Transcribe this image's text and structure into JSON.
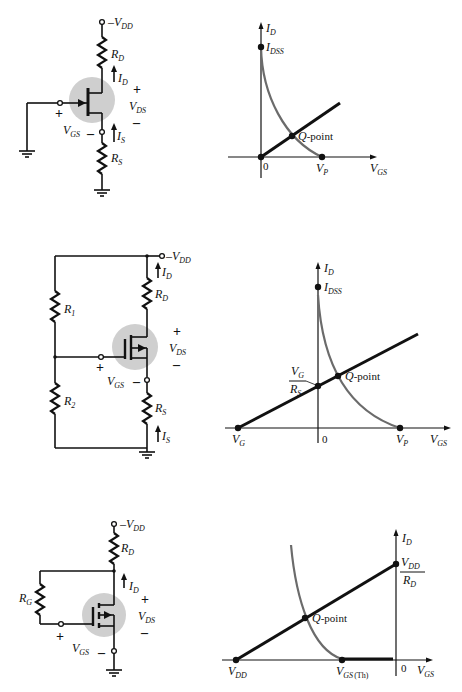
{
  "figure": {
    "panels": [
      {
        "id": "jfet-self-bias",
        "circuit": {
          "supply": {
            "prefix": "–V",
            "sub": "DD"
          },
          "drain_resistor": {
            "main": "R",
            "sub": "D"
          },
          "drain_current": {
            "main": "I",
            "sub": "D"
          },
          "source_current": {
            "main": "I",
            "sub": "S"
          },
          "source_resistor": {
            "main": "R",
            "sub": "S"
          },
          "vds": {
            "main": "V",
            "sub": "DS",
            "plus": "+",
            "minus": "–"
          },
          "vgs": {
            "main": "V",
            "sub": "GS",
            "plus": "+",
            "minus": "–"
          }
        },
        "graph": {
          "y_axis": {
            "main": "I",
            "sub": "D"
          },
          "x_axis": {
            "main": "V",
            "sub": "GS"
          },
          "idss": {
            "main": "I",
            "sub": "DSS"
          },
          "origin": "0",
          "vp": {
            "main": "V",
            "sub": "P"
          },
          "q_point": {
            "q": "Q",
            "rest": "-point"
          }
        }
      },
      {
        "id": "jfet-voltage-divider",
        "circuit": {
          "supply": {
            "prefix": "–V",
            "sub": "DD"
          },
          "r1": {
            "main": "R",
            "sub": "1"
          },
          "r2": {
            "main": "R",
            "sub": "2"
          },
          "drain_resistor": {
            "main": "R",
            "sub": "D"
          },
          "drain_current": {
            "main": "I",
            "sub": "D"
          },
          "source_current": {
            "main": "I",
            "sub": "S"
          },
          "source_resistor": {
            "main": "R",
            "sub": "S"
          },
          "vds": {
            "main": "V",
            "sub": "DS",
            "plus": "+",
            "minus": "–"
          },
          "vgs": {
            "main": "V",
            "sub": "GS",
            "plus": "+",
            "minus": "–"
          }
        },
        "graph": {
          "y_axis": {
            "main": "I",
            "sub": "D"
          },
          "x_axis": {
            "main": "V",
            "sub": "GS"
          },
          "idss": {
            "main": "I",
            "sub": "DSS"
          },
          "origin": "0",
          "vp": {
            "main": "V",
            "sub": "P"
          },
          "vg": {
            "main": "V",
            "sub": "G"
          },
          "intercept": {
            "num_main": "V",
            "num_sub": "G",
            "den_main": "R",
            "den_sub": "S"
          },
          "q_point": {
            "q": "Q",
            "rest": "-point"
          }
        }
      },
      {
        "id": "mosfet-feedback-bias",
        "circuit": {
          "supply": {
            "prefix": "–V",
            "sub": "DD"
          },
          "drain_resistor": {
            "main": "R",
            "sub": "D"
          },
          "gate_resistor": {
            "main": "R",
            "sub": "G"
          },
          "drain_current": {
            "main": "I",
            "sub": "D"
          },
          "vds": {
            "main": "V",
            "sub": "DS",
            "plus": "+",
            "minus": "–"
          },
          "vgs": {
            "main": "V",
            "sub": "GS",
            "plus": "+",
            "minus": "–"
          }
        },
        "graph": {
          "y_axis": {
            "main": "I",
            "sub": "D"
          },
          "x_axis": {
            "main": "V",
            "sub": "GS"
          },
          "origin": "0",
          "vdd": {
            "main": "V",
            "sub": "DD"
          },
          "vgs_th": {
            "main": "V",
            "sub": "GS",
            "tail": "(Th)"
          },
          "intercept": {
            "num_main": "V",
            "num_sub": "DD",
            "den_main": "R",
            "den_sub": "D"
          },
          "q_point": {
            "q": "Q",
            "rest": "-point"
          }
        }
      }
    ],
    "colors": {
      "ink": "#111111",
      "curve": "#6b6b6b",
      "device_highlight": "#cfcfcf",
      "background": "#ffffff"
    }
  }
}
